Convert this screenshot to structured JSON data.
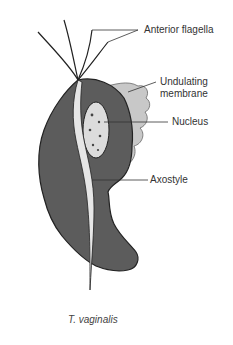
{
  "figure": {
    "caption": "T. vaginalis",
    "labels": {
      "anterior_flagella": "Anterior flagella",
      "undulating_membrane_line1": "Undulating",
      "undulating_membrane_line2": "membrane",
      "nucleus": "Nucleus",
      "axostyle": "Axostyle"
    },
    "colors": {
      "body": "#5c5c5c",
      "membrane": "#c8c8c8",
      "axostyle": "#e6e6e6",
      "nucleus": "#dcdcdc",
      "outline": "#222222"
    }
  }
}
